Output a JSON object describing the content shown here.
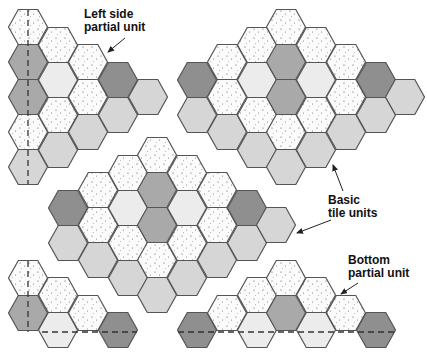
{
  "colors": {
    "dot": "#fbfbfb",
    "dark": "#8f8f8f",
    "mid": "#a9a9a9",
    "light": "#d6d6d6",
    "pale": "#ececec",
    "stroke": "#555555"
  },
  "labels": {
    "left_side": {
      "line1": "Left side",
      "line2": "partial unit"
    },
    "basic": {
      "line1": "Basic",
      "line2": "tile units"
    },
    "bottom": {
      "line1": "Bottom",
      "line2": "partial unit"
    }
  },
  "groups": [
    {
      "name": "left-side-partial-unit",
      "hexes": [
        [
          28,
          27,
          "dot"
        ],
        [
          28,
          62,
          "mid"
        ],
        [
          28,
          97,
          "mid"
        ],
        [
          28,
          132,
          "dot"
        ],
        [
          28,
          167,
          "light"
        ],
        [
          58,
          45,
          "dot"
        ],
        [
          58,
          80,
          "pale"
        ],
        [
          58,
          115,
          "dot"
        ],
        [
          58,
          150,
          "light"
        ],
        [
          88,
          62,
          "dot"
        ],
        [
          88,
          97,
          "dot"
        ],
        [
          88,
          132,
          "light"
        ],
        [
          118,
          80,
          "dark"
        ],
        [
          118,
          115,
          "light"
        ],
        [
          148,
          97,
          "light"
        ]
      ],
      "dashes": [
        [
          28,
          10,
          28,
          184
        ]
      ]
    },
    {
      "name": "top-right-basic-unit",
      "hexes": [
        [
          197,
          80,
          "dark"
        ],
        [
          197,
          115,
          "light"
        ],
        [
          227,
          62,
          "dot"
        ],
        [
          227,
          97,
          "dot"
        ],
        [
          227,
          132,
          "light"
        ],
        [
          257,
          45,
          "dot"
        ],
        [
          257,
          80,
          "pale"
        ],
        [
          257,
          115,
          "dot"
        ],
        [
          257,
          150,
          "light"
        ],
        [
          286,
          27,
          "dot"
        ],
        [
          286,
          62,
          "mid"
        ],
        [
          286,
          97,
          "mid"
        ],
        [
          286,
          132,
          "dot"
        ],
        [
          286,
          167,
          "light"
        ],
        [
          316,
          45,
          "dot"
        ],
        [
          316,
          80,
          "pale"
        ],
        [
          316,
          115,
          "dot"
        ],
        [
          316,
          150,
          "light"
        ],
        [
          346,
          62,
          "dot"
        ],
        [
          346,
          97,
          "dot"
        ],
        [
          346,
          132,
          "light"
        ],
        [
          376,
          80,
          "dark"
        ],
        [
          376,
          115,
          "light"
        ],
        [
          405,
          97,
          "light"
        ]
      ],
      "dashes": []
    },
    {
      "name": "middle-basic-unit",
      "hexes": [
        [
          68,
          208,
          "dark"
        ],
        [
          68,
          243,
          "light"
        ],
        [
          98,
          190,
          "dot"
        ],
        [
          98,
          225,
          "dot"
        ],
        [
          98,
          260,
          "light"
        ],
        [
          128,
          173,
          "dot"
        ],
        [
          128,
          208,
          "pale"
        ],
        [
          128,
          243,
          "dot"
        ],
        [
          128,
          278,
          "light"
        ],
        [
          157,
          155,
          "dot"
        ],
        [
          157,
          190,
          "mid"
        ],
        [
          157,
          225,
          "mid"
        ],
        [
          157,
          260,
          "dot"
        ],
        [
          157,
          295,
          "light"
        ],
        [
          187,
          173,
          "dot"
        ],
        [
          187,
          208,
          "pale"
        ],
        [
          187,
          243,
          "dot"
        ],
        [
          187,
          278,
          "light"
        ],
        [
          217,
          190,
          "dot"
        ],
        [
          217,
          225,
          "dot"
        ],
        [
          217,
          260,
          "light"
        ],
        [
          247,
          208,
          "dark"
        ],
        [
          247,
          243,
          "light"
        ],
        [
          276,
          225,
          "light"
        ]
      ],
      "dashes": []
    },
    {
      "name": "bottom-left-partial-unit",
      "hexes": [
        [
          28,
          278,
          "dot"
        ],
        [
          28,
          313,
          "mid"
        ],
        [
          58,
          295,
          "dot"
        ],
        [
          58,
          330,
          "pale"
        ],
        [
          88,
          313,
          "dot"
        ],
        [
          118,
          330,
          "dark"
        ]
      ],
      "dashes": [
        [
          28,
          261,
          28,
          332
        ],
        [
          42,
          332,
          137,
          332
        ]
      ]
    },
    {
      "name": "bottom-partial-unit",
      "hexes": [
        [
          197,
          330,
          "dark"
        ],
        [
          227,
          313,
          "dot"
        ],
        [
          257,
          295,
          "dot"
        ],
        [
          257,
          330,
          "pale"
        ],
        [
          286,
          278,
          "dot"
        ],
        [
          286,
          313,
          "mid"
        ],
        [
          316,
          295,
          "dot"
        ],
        [
          316,
          330,
          "pale"
        ],
        [
          346,
          313,
          "dot"
        ],
        [
          376,
          330,
          "dark"
        ]
      ],
      "dashes": [
        [
          178,
          332,
          395,
          332
        ]
      ]
    }
  ],
  "arrows": [
    {
      "name": "left-side-arrow",
      "from": [
        125,
        38
      ],
      "to": [
        108,
        52
      ]
    },
    {
      "name": "basic-arrow-up",
      "from": [
        343,
        191
      ],
      "to": [
        333,
        165
      ]
    },
    {
      "name": "basic-arrow-left",
      "from": [
        331,
        220
      ],
      "to": [
        297,
        233
      ]
    },
    {
      "name": "bottom-arrow",
      "from": [
        358,
        283
      ],
      "to": [
        341,
        294
      ]
    }
  ]
}
